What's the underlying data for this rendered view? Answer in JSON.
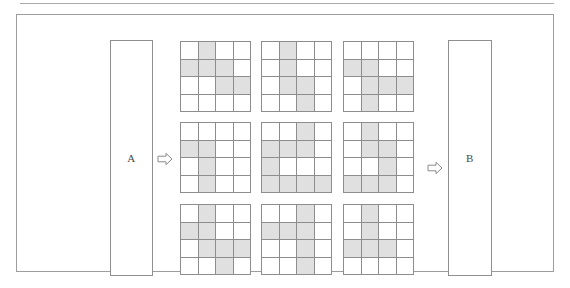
{
  "figure": {
    "title_rule": "",
    "left_panel": {
      "label": "A"
    },
    "right_panel": {
      "label": "B"
    },
    "arrows": [
      {
        "name": "arrow-a-to-grids",
        "direction": "right"
      },
      {
        "name": "arrow-grids-to-b",
        "direction": "right"
      }
    ]
  },
  "chart_data": {
    "type": "heatmap",
    "title": "",
    "xlabel": "",
    "ylabel": "",
    "grid_rows": 4,
    "grid_cols": 4,
    "matrix_rows": 3,
    "matrix_cols": 3,
    "filled_color": "#e0e0e0",
    "empty_color": "#ffffff",
    "line_color": "#8d8d8d",
    "legend": [],
    "grids": [
      {
        "id": "grid-1",
        "position": {
          "row": 0,
          "col": 0
        },
        "cells": [
          [
            0,
            1,
            0,
            0
          ],
          [
            1,
            1,
            1,
            0
          ],
          [
            0,
            0,
            1,
            1
          ],
          [
            0,
            0,
            0,
            0
          ]
        ],
        "filled_count": 6
      },
      {
        "id": "grid-2",
        "position": {
          "row": 0,
          "col": 1
        },
        "cells": [
          [
            0,
            1,
            0,
            0
          ],
          [
            0,
            1,
            0,
            0
          ],
          [
            0,
            1,
            1,
            0
          ],
          [
            0,
            0,
            1,
            0
          ]
        ],
        "filled_count": 5
      },
      {
        "id": "grid-3",
        "position": {
          "row": 0,
          "col": 2
        },
        "cells": [
          [
            0,
            0,
            0,
            0
          ],
          [
            1,
            1,
            0,
            0
          ],
          [
            0,
            1,
            1,
            1
          ],
          [
            0,
            1,
            0,
            0
          ]
        ],
        "filled_count": 6
      },
      {
        "id": "grid-4",
        "position": {
          "row": 1,
          "col": 0
        },
        "cells": [
          [
            0,
            0,
            0,
            0
          ],
          [
            1,
            1,
            0,
            0
          ],
          [
            0,
            1,
            0,
            0
          ],
          [
            0,
            1,
            0,
            0
          ]
        ],
        "filled_count": 4
      },
      {
        "id": "grid-5",
        "position": {
          "row": 1,
          "col": 1
        },
        "cells": [
          [
            0,
            0,
            1,
            0
          ],
          [
            1,
            1,
            1,
            0
          ],
          [
            1,
            0,
            0,
            0
          ],
          [
            1,
            1,
            1,
            1
          ]
        ],
        "filled_count": 9
      },
      {
        "id": "grid-6",
        "position": {
          "row": 1,
          "col": 2
        },
        "cells": [
          [
            0,
            1,
            0,
            0
          ],
          [
            0,
            1,
            1,
            0
          ],
          [
            0,
            0,
            1,
            0
          ],
          [
            1,
            1,
            1,
            0
          ]
        ],
        "filled_count": 7
      },
      {
        "id": "grid-7",
        "position": {
          "row": 2,
          "col": 0
        },
        "cells": [
          [
            0,
            1,
            0,
            0
          ],
          [
            1,
            1,
            0,
            0
          ],
          [
            0,
            1,
            1,
            1
          ],
          [
            0,
            0,
            1,
            0
          ]
        ],
        "filled_count": 7
      },
      {
        "id": "grid-8",
        "position": {
          "row": 2,
          "col": 1
        },
        "cells": [
          [
            0,
            0,
            1,
            0
          ],
          [
            1,
            1,
            1,
            0
          ],
          [
            0,
            0,
            1,
            0
          ],
          [
            0,
            0,
            1,
            0
          ]
        ],
        "filled_count": 6
      },
      {
        "id": "grid-9",
        "position": {
          "row": 2,
          "col": 2
        },
        "cells": [
          [
            0,
            1,
            0,
            0
          ],
          [
            0,
            1,
            0,
            0
          ],
          [
            1,
            1,
            1,
            0
          ],
          [
            0,
            0,
            0,
            0
          ]
        ],
        "filled_count": 5
      }
    ]
  }
}
